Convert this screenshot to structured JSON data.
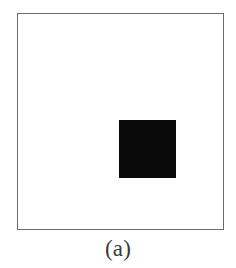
{
  "figure": {
    "caption": "(a)",
    "canvas": {
      "width": 236,
      "height": 268,
      "background_color": "#ffffff"
    },
    "frame": {
      "name": "image-border",
      "x": 17,
      "y": 13,
      "width": 207,
      "height": 217,
      "border_color": "#6b6b6b",
      "border_width": 1,
      "fill_color": "#ffffff"
    },
    "shapes": [
      {
        "name": "black-square",
        "type": "square",
        "fill_color": "#0a0a0a",
        "x": 119,
        "y": 120,
        "width": 57,
        "height": 58
      }
    ]
  }
}
